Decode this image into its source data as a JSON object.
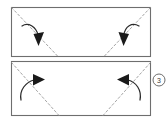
{
  "diagram": {
    "type": "folding-instruction",
    "background_color": "#ffffff",
    "outline_color": "#6e6e6e",
    "fold_line_color": "#9a9a9a",
    "arrow_color": "#1a1a1a",
    "step_marker": {
      "label": "3",
      "shape": "circle",
      "color": "#5c5c5c",
      "position": "right-edge-middle"
    },
    "panels": [
      {
        "name": "top-panel",
        "x": 11,
        "y": 7,
        "width": 140,
        "height": 50,
        "fold_lines": [
          {
            "name": "top-left-diagonal",
            "x1": 11,
            "y1": 7,
            "x2": 58,
            "y2": 57
          },
          {
            "name": "top-right-diagonal",
            "x1": 151,
            "y1": 7,
            "x2": 104,
            "y2": 57
          }
        ],
        "arrows": [
          {
            "name": "top-left-fold-arrow",
            "direction": "down",
            "tip_x": 38,
            "tip_y": 44
          },
          {
            "name": "top-right-fold-arrow",
            "direction": "down",
            "tip_x": 124,
            "tip_y": 44
          }
        ]
      },
      {
        "name": "bottom-panel",
        "x": 11,
        "y": 61,
        "width": 140,
        "height": 55,
        "fold_lines": [
          {
            "name": "bottom-left-diagonal",
            "x1": 11,
            "y1": 63,
            "x2": 58,
            "y2": 116
          },
          {
            "name": "bottom-right-diagonal",
            "x1": 151,
            "y1": 63,
            "x2": 104,
            "y2": 116
          }
        ],
        "arrows": [
          {
            "name": "bottom-left-fold-arrow",
            "direction": "up-right",
            "tip_x": 42,
            "tip_y": 80
          },
          {
            "name": "bottom-right-fold-arrow",
            "direction": "up-left",
            "tip_x": 120,
            "tip_y": 80
          }
        ]
      }
    ]
  }
}
